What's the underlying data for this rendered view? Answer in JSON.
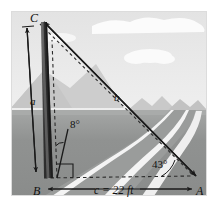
{
  "figure": {
    "type": "geometry-diagram",
    "scene": {
      "sky_color": "#e6e6e6",
      "cloud_color": "#f7f7f7",
      "far_mountain_color": "#cfcfcf",
      "mid_mountain_color": "#bdbdbd",
      "ground_color": "#8f9190",
      "ground_far_color": "#a7a9a8",
      "road_color": "#9c9e9d",
      "road_line_color": "#f2f2f2",
      "pole_color": "#3a3a3a",
      "pole_highlight_color": "#777777",
      "line_color": "#1a1a1a",
      "border_color": "#d8d8d8"
    },
    "vertices": {
      "A": {
        "label": "A",
        "x": 196,
        "y": 178
      },
      "B": {
        "label": "B",
        "x": 40,
        "y": 178
      },
      "C": {
        "label": "C",
        "x": 38,
        "y": 20
      }
    },
    "sides": [
      {
        "name": "side-a",
        "label": "a",
        "x": 34,
        "y": 101,
        "from": "B",
        "to": "C"
      },
      {
        "name": "side-b",
        "label": "b",
        "x": 118,
        "y": 97,
        "from": "C",
        "to": "A"
      },
      {
        "name": "side-c",
        "label": "c = 22 ft",
        "x": 110,
        "y": 189,
        "from": "B",
        "to": "A"
      }
    ],
    "angles": [
      {
        "name": "angle-tilt",
        "label": "8°",
        "x": 76,
        "y": 123,
        "at": "B",
        "between": "pole-and-vertical"
      },
      {
        "name": "angle-elevation",
        "label": "43°",
        "x": 163,
        "y": 163,
        "at": "A",
        "between": "ground-and-line-to-C"
      }
    ],
    "markers": {
      "right_angle": {
        "name": "right-angle-marker",
        "x": 55,
        "y": 162
      }
    },
    "measurement_label": "c = 22 ft",
    "units": "ft",
    "distance_value": 22,
    "tilt_angle_deg": 8,
    "elevation_angle_deg": 43
  }
}
